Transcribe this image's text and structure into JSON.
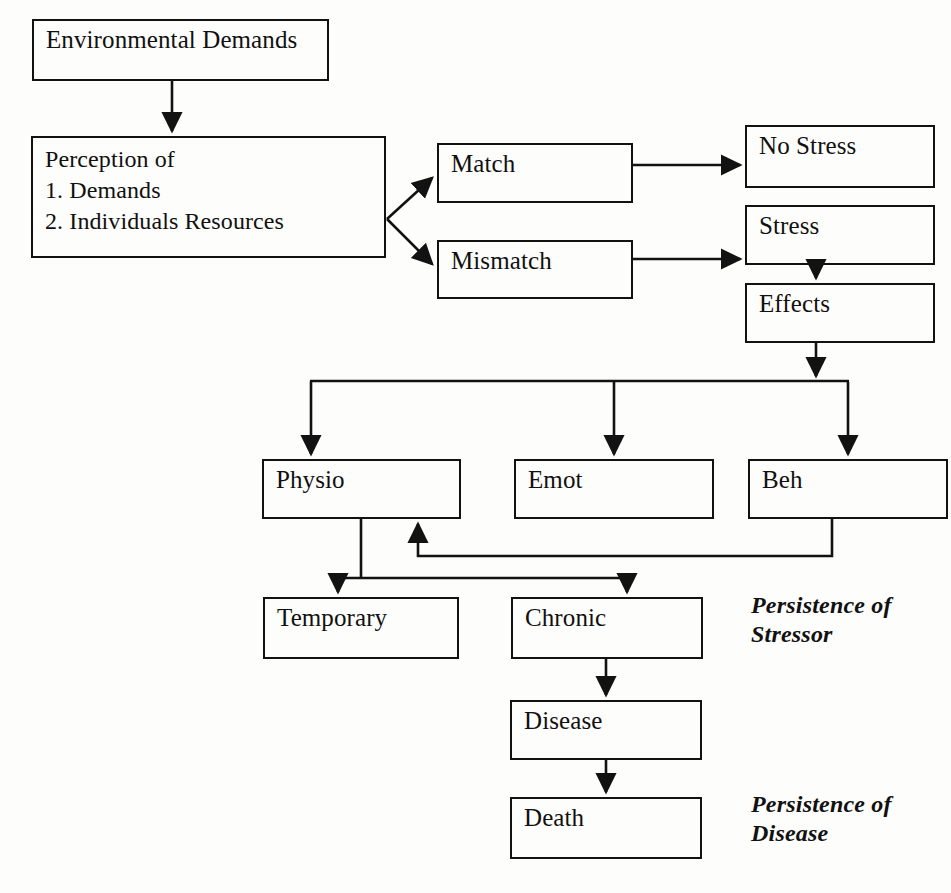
{
  "diagram": {
    "line_color": "#121212",
    "background_color": "#fdfdfb",
    "nodes": [
      {
        "id": "environmental-demands",
        "label": "Environmental Demands",
        "x": 32,
        "y": 19,
        "w": 297,
        "h": 62
      },
      {
        "id": "perception",
        "label": "Perception of\n1. Demands\n2. Individuals Resources",
        "x": 31,
        "y": 136,
        "w": 355,
        "h": 122
      },
      {
        "id": "match",
        "label": "Match",
        "x": 437,
        "y": 143,
        "w": 196,
        "h": 60
      },
      {
        "id": "mismatch",
        "label": "Mismatch",
        "x": 437,
        "y": 240,
        "w": 196,
        "h": 59
      },
      {
        "id": "no-stress",
        "label": "No Stress",
        "x": 745,
        "y": 125,
        "w": 190,
        "h": 63
      },
      {
        "id": "stress",
        "label": "Stress",
        "x": 745,
        "y": 205,
        "w": 190,
        "h": 60
      },
      {
        "id": "effects",
        "label": "Effects",
        "x": 745,
        "y": 283,
        "w": 190,
        "h": 60
      },
      {
        "id": "physio",
        "label": "Physio",
        "x": 262,
        "y": 459,
        "w": 199,
        "h": 60
      },
      {
        "id": "emot",
        "label": "Emot",
        "x": 514,
        "y": 459,
        "w": 200,
        "h": 60
      },
      {
        "id": "beh",
        "label": "Beh",
        "x": 748,
        "y": 459,
        "w": 200,
        "h": 60
      },
      {
        "id": "temporary",
        "label": "Temporary",
        "x": 263,
        "y": 597,
        "w": 196,
        "h": 62
      },
      {
        "id": "chronic",
        "label": "Chronic",
        "x": 511,
        "y": 597,
        "w": 192,
        "h": 62
      },
      {
        "id": "disease",
        "label": "Disease",
        "x": 510,
        "y": 700,
        "w": 192,
        "h": 60
      },
      {
        "id": "death",
        "label": "Death",
        "x": 510,
        "y": 797,
        "w": 192,
        "h": 62
      }
    ],
    "annotations": [
      {
        "id": "persistence-of-stressor",
        "text": "Persistence of\nStressor",
        "x": 751,
        "y": 591
      },
      {
        "id": "persistence-of-disease",
        "text": "Persistence of\nDisease",
        "x": 751,
        "y": 790
      }
    ],
    "edges": [
      {
        "id": "environmental-demands-to-perception",
        "from": "environmental-demands",
        "to": "perception"
      },
      {
        "id": "perception-to-match",
        "from": "perception",
        "to": "match"
      },
      {
        "id": "perception-to-mismatch",
        "from": "perception",
        "to": "mismatch"
      },
      {
        "id": "match-to-no-stress",
        "from": "match",
        "to": "no-stress"
      },
      {
        "id": "mismatch-to-stress",
        "from": "mismatch",
        "to": "stress"
      },
      {
        "id": "stress-to-effects",
        "from": "stress",
        "to": "effects"
      },
      {
        "id": "effects-to-physio",
        "from": "effects",
        "to": "physio"
      },
      {
        "id": "effects-to-emot",
        "from": "effects",
        "to": "emot"
      },
      {
        "id": "effects-to-beh",
        "from": "effects",
        "to": "beh"
      },
      {
        "id": "physio-to-temporary",
        "from": "physio",
        "to": "temporary"
      },
      {
        "id": "physio-to-chronic",
        "from": "physio",
        "to": "chronic"
      },
      {
        "id": "chronic-to-disease",
        "from": "chronic",
        "to": "disease"
      },
      {
        "id": "disease-to-death",
        "from": "disease",
        "to": "death"
      },
      {
        "id": "beh-feedback-to-physio",
        "from": "beh",
        "to": "physio"
      }
    ]
  }
}
